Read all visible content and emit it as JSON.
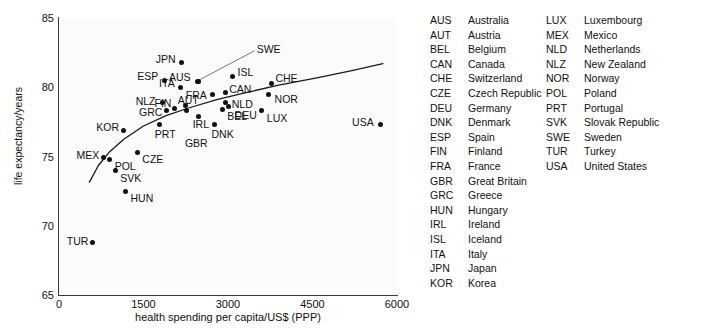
{
  "chart_data": {
    "type": "scatter",
    "title": "",
    "xlabel": "health spending per capita/US$ (PPP)",
    "ylabel": "life expectancy/years",
    "xlim": [
      0,
      6000
    ],
    "ylim": [
      65,
      85
    ],
    "xticks": [
      0,
      1500,
      3000,
      4500,
      6000
    ],
    "yticks": [
      65,
      70,
      75,
      80,
      85
    ],
    "grid": false,
    "legend_position": "right",
    "trendline": {
      "present": true,
      "description": "logarithmic best-fit curve rising from about 73.1 years at 550 US$ to about 81.8 years at 5700 US$",
      "points": [
        {
          "x": 540,
          "y": 73.15
        },
        {
          "x": 700,
          "y": 74.35
        },
        {
          "x": 900,
          "y": 75.35
        },
        {
          "x": 1150,
          "y": 76.25
        },
        {
          "x": 1500,
          "y": 77.2
        },
        {
          "x": 1900,
          "y": 77.95
        },
        {
          "x": 2300,
          "y": 78.5
        },
        {
          "x": 2800,
          "y": 79.1
        },
        {
          "x": 3300,
          "y": 79.6
        },
        {
          "x": 3900,
          "y": 80.15
        },
        {
          "x": 4600,
          "y": 80.7
        },
        {
          "x": 5200,
          "y": 81.2
        },
        {
          "x": 5750,
          "y": 81.7
        }
      ]
    },
    "points": [
      {
        "code": "TUR",
        "x": 600,
        "y": 68.8,
        "label_dx": -26,
        "label_dy": -1
      },
      {
        "code": "MEX",
        "x": 790,
        "y": 74.9,
        "label_dx": -27,
        "label_dy": -3
      },
      {
        "code": "POL",
        "x": 900,
        "y": 74.8,
        "label_dx": 5,
        "label_dy": 7
      },
      {
        "code": "SVK",
        "x": 1000,
        "y": 74.0,
        "label_dx": 5,
        "label_dy": 8
      },
      {
        "code": "KOR",
        "x": 1140,
        "y": 76.9,
        "label_dx": -27,
        "label_dy": -3
      },
      {
        "code": "HUN",
        "x": 1180,
        "y": 72.5,
        "label_dx": 5,
        "label_dy": 7
      },
      {
        "code": "CZE",
        "x": 1390,
        "y": 75.3,
        "label_dx": 5,
        "label_dy": 7
      },
      {
        "code": "PRT",
        "x": 1790,
        "y": 77.3,
        "label_dx": -5,
        "label_dy": 9
      },
      {
        "code": "NLZ",
        "x": 1840,
        "y": 78.9,
        "label_dx": -27,
        "label_dy": -1
      },
      {
        "code": "ESP",
        "x": 1870,
        "y": 80.5,
        "label_dx": -27,
        "label_dy": -4
      },
      {
        "code": "GRC",
        "x": 1900,
        "y": 78.3,
        "label_dx": -27,
        "label_dy": 1
      },
      {
        "code": "FIN",
        "x": 2050,
        "y": 78.5,
        "label_dx": -20,
        "label_dy": -5
      },
      {
        "code": "ITA",
        "x": 2150,
        "y": 80.0,
        "label_dx": -21,
        "label_dy": -4
      },
      {
        "code": "JPN",
        "x": 2180,
        "y": 81.8,
        "label_dx": -26,
        "label_dy": -3
      },
      {
        "code": "AUT",
        "x": 2250,
        "y": 78.7,
        "label_dx": -8,
        "label_dy": -5
      },
      {
        "code": "GBR",
        "x": 2270,
        "y": 78.3,
        "label_dx": -2,
        "label_dy": 32
      },
      {
        "code": "AUS",
        "x": 2450,
        "y": 80.4,
        "label_dx": -28,
        "label_dy": -5
      },
      {
        "code": "IRL",
        "x": 2480,
        "y": 77.9,
        "label_dx": -6,
        "label_dy": 8
      },
      {
        "code": "FRA",
        "x": 2730,
        "y": 79.5,
        "label_dx": -27,
        "label_dy": 1
      },
      {
        "code": "DNK",
        "x": 2760,
        "y": 77.3,
        "label_dx": -3,
        "label_dy": 9
      },
      {
        "code": "SWE",
        "x": 2480,
        "y": 80.4,
        "label_dx": 58,
        "label_dy": -33
      },
      {
        "code": "BEL",
        "x": 2900,
        "y": 78.4,
        "label_dx": 5,
        "label_dy": 7
      },
      {
        "code": "CAN",
        "x": 2950,
        "y": 79.6,
        "label_dx": 4,
        "label_dy": -4
      },
      {
        "code": "NLD",
        "x": 2960,
        "y": 78.9,
        "label_dx": 6,
        "label_dy": 2
      },
      {
        "code": "DEU",
        "x": 3010,
        "y": 78.6,
        "label_dx": 6,
        "label_dy": 8
      },
      {
        "code": "ISL",
        "x": 3080,
        "y": 80.8,
        "label_dx": 5,
        "label_dy": -4
      },
      {
        "code": "LUX",
        "x": 3600,
        "y": 78.3,
        "label_dx": 5,
        "label_dy": 7
      },
      {
        "code": "NOR",
        "x": 3720,
        "y": 79.5,
        "label_dx": 6,
        "label_dy": 5
      },
      {
        "code": "CHE",
        "x": 3770,
        "y": 80.3,
        "label_dx": 4,
        "label_dy": -5
      },
      {
        "code": "USA",
        "x": 5700,
        "y": 77.3,
        "label_dx": -28,
        "label_dy": -3
      }
    ]
  },
  "legend": {
    "column_1": [
      {
        "code": "AUS",
        "name": "Australia"
      },
      {
        "code": "AUT",
        "name": "Austria"
      },
      {
        "code": "BEL",
        "name": "Belgium"
      },
      {
        "code": "CAN",
        "name": "Canada"
      },
      {
        "code": "CHE",
        "name": "Switzerland"
      },
      {
        "code": "CZE",
        "name": "Czech Republic"
      },
      {
        "code": "DEU",
        "name": "Germany"
      },
      {
        "code": "DNK",
        "name": "Denmark"
      },
      {
        "code": "ESP",
        "name": "Spain"
      },
      {
        "code": "FIN",
        "name": "Finland"
      },
      {
        "code": "FRA",
        "name": "France"
      },
      {
        "code": "GBR",
        "name": "Great Britain"
      },
      {
        "code": "GRC",
        "name": "Greece"
      },
      {
        "code": "HUN",
        "name": "Hungary"
      },
      {
        "code": "IRL",
        "name": "Ireland"
      },
      {
        "code": "ISL",
        "name": "Iceland"
      },
      {
        "code": "ITA",
        "name": "Italy"
      },
      {
        "code": "JPN",
        "name": "Japan"
      },
      {
        "code": "KOR",
        "name": "Korea"
      }
    ],
    "column_2": [
      {
        "code": "LUX",
        "name": "Luxembourg"
      },
      {
        "code": "MEX",
        "name": "Mexico"
      },
      {
        "code": "NLD",
        "name": "Netherlands"
      },
      {
        "code": "NLZ",
        "name": "New Zealand"
      },
      {
        "code": "NOR",
        "name": "Norway"
      },
      {
        "code": "POL",
        "name": "Poland"
      },
      {
        "code": "PRT",
        "name": "Portugal"
      },
      {
        "code": "SVK",
        "name": "Slovak Republic"
      },
      {
        "code": "SWE",
        "name": "Sweden"
      },
      {
        "code": "TUR",
        "name": "Turkey"
      },
      {
        "code": "USA",
        "name": "United States"
      }
    ]
  },
  "colors": {
    "point": "#111111",
    "axis": "#3a3a3a",
    "text": "#111111",
    "plot_background": "#fbfbfb",
    "page_background": "#ffffff"
  }
}
